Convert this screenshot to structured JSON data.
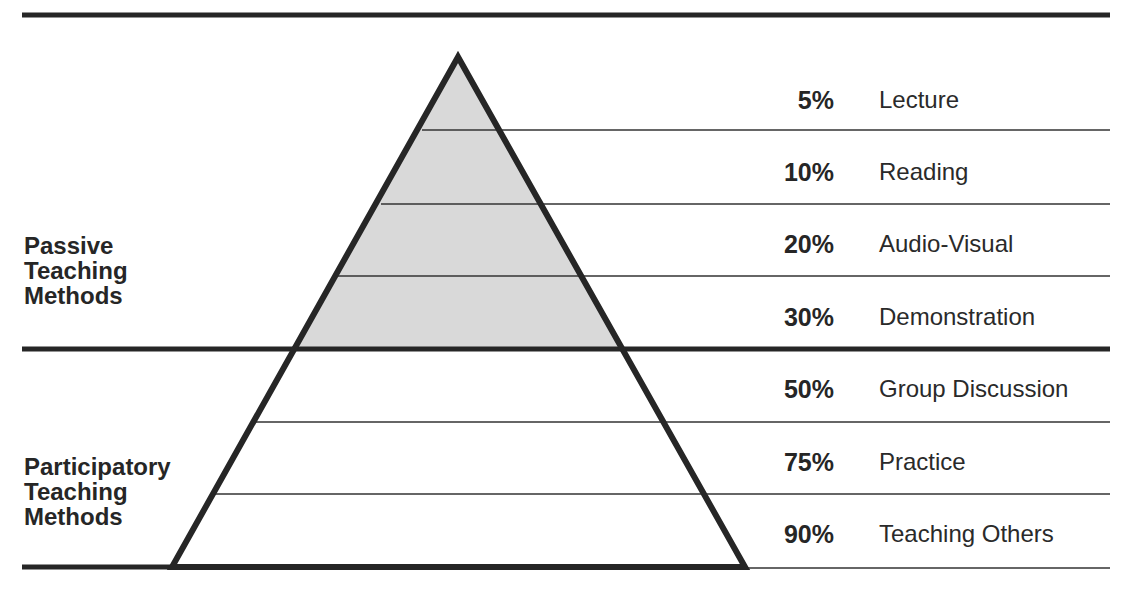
{
  "diagram": {
    "type": "learning-pyramid",
    "colors": {
      "line": "#262626",
      "shaded_fill": "#d9d9d9",
      "background": "#ffffff"
    },
    "groups": [
      {
        "label_lines": [
          "Passive",
          "Teaching",
          "Methods"
        ],
        "shaded": true
      },
      {
        "label_lines": [
          "Participatory",
          "Teaching",
          "Methods"
        ],
        "shaded": false
      }
    ],
    "levels": [
      {
        "percent": "5%",
        "method": "Lecture",
        "group": "passive"
      },
      {
        "percent": "10%",
        "method": "Reading",
        "group": "passive"
      },
      {
        "percent": "20%",
        "method": "Audio-Visual",
        "group": "passive"
      },
      {
        "percent": "30%",
        "method": "Demonstration",
        "group": "passive"
      },
      {
        "percent": "50%",
        "method": "Group Discussion",
        "group": "participatory"
      },
      {
        "percent": "75%",
        "method": "Practice",
        "group": "participatory"
      },
      {
        "percent": "90%",
        "method": "Teaching Others",
        "group": "participatory"
      }
    ]
  }
}
